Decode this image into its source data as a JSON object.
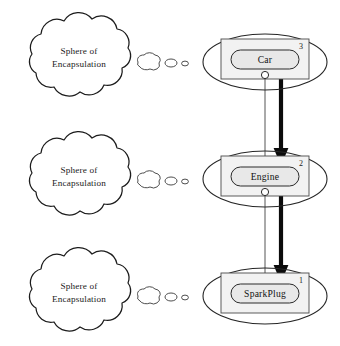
{
  "figure": {
    "background_color": "#ffffff",
    "width": 340,
    "height": 346
  },
  "colors": {
    "outline": "#1c1c1c",
    "ellipse_stroke": "#262626",
    "inner_rect_fill": "#f2f2f2",
    "inner_rect_stroke": "#4a4a4a",
    "pill_fill": "#e8e8e8",
    "pill_stroke": "#2a2a2a",
    "thin_connector": "#555555",
    "thick_connector": "#0b0b0b",
    "text": "#111111"
  },
  "clouds": [
    {
      "id": "cloud-top",
      "line1": "Sphere of",
      "line2": "Encapsulation",
      "center_x": 75,
      "center_y": 57,
      "puffs": [
        {
          "cx": 148,
          "cy": 62,
          "rx": 11,
          "ry": 7
        },
        {
          "cx": 171,
          "cy": 63,
          "rx": 6,
          "ry": 4
        },
        {
          "cx": 185,
          "cy": 63.5,
          "rx": 3.4,
          "ry": 2.4
        }
      ]
    },
    {
      "id": "cloud-middle",
      "line1": "Sphere of",
      "line2": "Encapsulation",
      "center_x": 75,
      "center_y": 176,
      "puffs": [
        {
          "cx": 148,
          "cy": 180,
          "rx": 11,
          "ry": 7
        },
        {
          "cx": 171,
          "cy": 181,
          "rx": 6,
          "ry": 4
        },
        {
          "cx": 185,
          "cy": 181.5,
          "rx": 3.4,
          "ry": 2.4
        }
      ]
    },
    {
      "id": "cloud-bottom",
      "line1": "Sphere of",
      "line2": "Encapsulation",
      "center_x": 75,
      "center_y": 292,
      "puffs": [
        {
          "cx": 148,
          "cy": 296,
          "rx": 11,
          "ry": 7
        },
        {
          "cx": 171,
          "cy": 297,
          "rx": 6,
          "ry": 4
        },
        {
          "cx": 185,
          "cy": 297.5,
          "rx": 3.4,
          "ry": 2.4
        }
      ]
    }
  ],
  "nodes": [
    {
      "id": "node-car",
      "label": "Car",
      "number": "3",
      "ellipse": {
        "cx": 265,
        "cy": 62,
        "rx": 62,
        "ry": 28
      },
      "rect": {
        "x": 221,
        "y": 39,
        "w": 88,
        "h": 40
      },
      "pill": {
        "x": 231,
        "y": 50,
        "w": 68,
        "h": 19,
        "r": 9.5
      },
      "number_pos": {
        "x": 301,
        "y": 49
      },
      "socket": {
        "cx": 265,
        "cy": 75,
        "r": 3.6
      }
    },
    {
      "id": "node-engine",
      "label": "Engine",
      "number": "2",
      "ellipse": {
        "cx": 265,
        "cy": 179,
        "rx": 62,
        "ry": 28
      },
      "rect": {
        "x": 221,
        "y": 156,
        "w": 88,
        "h": 40
      },
      "pill": {
        "x": 231,
        "y": 167,
        "w": 68,
        "h": 19,
        "r": 9.5
      },
      "number_pos": {
        "x": 301,
        "y": 166
      },
      "socket": {
        "cx": 265,
        "cy": 192,
        "r": 3.6
      }
    },
    {
      "id": "node-sparkplug",
      "label": "SparkPlug",
      "number": "1",
      "ellipse": {
        "cx": 265,
        "cy": 296,
        "rx": 62,
        "ry": 28
      },
      "rect": {
        "x": 221,
        "y": 273,
        "w": 88,
        "h": 40
      },
      "pill": {
        "x": 231,
        "y": 284,
        "w": 68,
        "h": 19,
        "r": 9.5
      },
      "number_pos": {
        "x": 301,
        "y": 283
      },
      "socket": {
        "cx": 265,
        "cy": 307,
        "r": 3.6
      }
    }
  ],
  "connectors": [
    {
      "id": "connector-thin-car-engine",
      "kind": "thin",
      "from": "node-car",
      "to": "node-engine",
      "x": 265,
      "y1": 79,
      "y2": 192
    },
    {
      "id": "connector-thick-car-engine",
      "kind": "thick-arrow",
      "from": "node-car",
      "to": "node-engine",
      "x": 281,
      "y1": 79,
      "y2": 154
    },
    {
      "id": "connector-thin-engine-sparkplug",
      "kind": "thin",
      "from": "node-engine",
      "to": "node-sparkplug",
      "x": 265,
      "y1": 196,
      "y2": 300
    },
    {
      "id": "connector-thick-engine-sparkplug",
      "kind": "thick-arrow",
      "from": "node-engine",
      "to": "node-sparkplug",
      "x": 281,
      "y1": 196,
      "y2": 271
    }
  ]
}
